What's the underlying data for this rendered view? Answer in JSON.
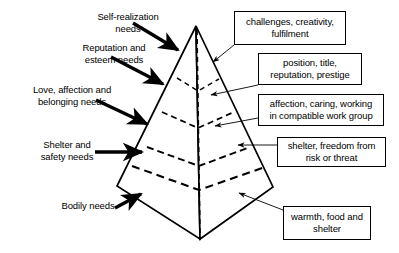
{
  "diagram": {
    "type": "maslow-hierarchy-pyramid",
    "background_color": "#ffffff",
    "line_color": "#000000",
    "tier_count": 5,
    "left_labels": [
      {
        "id": "self-realization",
        "text": "Self-realization\nneeds",
        "x": 73,
        "y": 11,
        "width": 110,
        "arrow": {
          "x1": 133,
          "y1": 23,
          "x2": 178,
          "y2": 50
        }
      },
      {
        "id": "reputation-esteem",
        "text": "Reputation and\nesteem needs",
        "x": 59,
        "y": 42,
        "width": 110,
        "arrow": {
          "x1": 111,
          "y1": 57,
          "x2": 163,
          "y2": 84
        }
      },
      {
        "id": "love-belonging",
        "text": "Love, affection and\nbelonging needs",
        "x": 12,
        "y": 84,
        "width": 120,
        "arrow": {
          "x1": 96,
          "y1": 100,
          "x2": 147,
          "y2": 124
        }
      },
      {
        "id": "shelter-safety",
        "text": "Shelter and\nsafety needs",
        "x": 18,
        "y": 139,
        "width": 98,
        "arrow": {
          "x1": 95,
          "y1": 152,
          "x2": 142,
          "y2": 152
        }
      },
      {
        "id": "bodily",
        "text": "Bodily needs",
        "x": 45,
        "y": 200,
        "width": 86,
        "arrow": {
          "x1": 115,
          "y1": 208,
          "x2": 141,
          "y2": 194
        }
      }
    ],
    "callout_boxes": [
      {
        "id": "challenges-creativity",
        "text": "challenges, creativity,\nfulfilment",
        "x": 234,
        "y": 11,
        "width": 112,
        "height": 34,
        "leader": {
          "x1": 234,
          "y1": 45,
          "x2": 213,
          "y2": 62
        }
      },
      {
        "id": "position-title",
        "text": "position, title,\nreputation, prestige",
        "x": 258,
        "y": 53,
        "width": 104,
        "height": 32,
        "leader": {
          "x1": 258,
          "y1": 85,
          "x2": 211,
          "y2": 95
        }
      },
      {
        "id": "affection-caring",
        "text": "affection, caring, working\nin compatible work group",
        "x": 258,
        "y": 94,
        "width": 126,
        "height": 32,
        "leader": {
          "x1": 258,
          "y1": 118,
          "x2": 215,
          "y2": 126
        }
      },
      {
        "id": "shelter-freedom",
        "text": "shelter, freedom from\nrisk or threat",
        "x": 277,
        "y": 137,
        "width": 109,
        "height": 30,
        "leader": {
          "x1": 277,
          "y1": 145,
          "x2": 238,
          "y2": 145
        }
      },
      {
        "id": "warmth-food",
        "text": "warmth, food and\nshelter",
        "x": 283,
        "y": 206,
        "width": 88,
        "height": 34,
        "leader": {
          "x1": 283,
          "y1": 210,
          "x2": 239,
          "y2": 193
        }
      }
    ],
    "pyramid": {
      "apex": {
        "x": 196,
        "y": 26
      },
      "left_corner": {
        "x": 117,
        "y": 186
      },
      "right_corner": {
        "x": 273,
        "y": 187
      },
      "front_bottom": {
        "x": 200,
        "y": 239
      },
      "tier_dividers": [
        {
          "left_x": 177,
          "left_y": 78,
          "center_x": 198,
          "center_y": 91,
          "right_x": 219,
          "right_y": 79
        },
        {
          "left_x": 162,
          "left_y": 112,
          "center_x": 198,
          "center_y": 128,
          "right_x": 234,
          "right_y": 112
        },
        {
          "left_x": 147,
          "left_y": 147,
          "center_x": 199,
          "center_y": 166,
          "right_x": 250,
          "right_y": 147
        },
        {
          "left_x": 132,
          "left_y": 166,
          "center_x": 199,
          "center_y": 190,
          "right_x": 265,
          "right_y": 167
        }
      ]
    }
  }
}
